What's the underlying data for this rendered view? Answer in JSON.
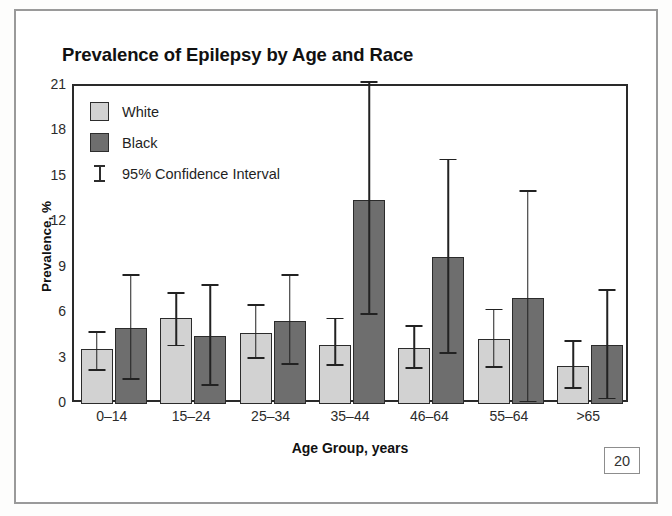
{
  "figure": {
    "number_label": "20"
  },
  "chart_data": {
    "type": "bar",
    "title": "Prevalence of Epilepsy by Age and Race",
    "xlabel": "Age Group, years",
    "ylabel": "Prevalence, %",
    "ylim": [
      0,
      21
    ],
    "ytick_labels": [
      "0",
      "3",
      "6",
      "9",
      "12",
      "15",
      "18",
      "21"
    ],
    "ytick_values": [
      0,
      3,
      6,
      9,
      12,
      15,
      18,
      21
    ],
    "grid": false,
    "legend_position": "top-left-inside",
    "categories": [
      "0–14",
      "15–24",
      "25–34",
      "35–44",
      "46–64",
      "55–64",
      ">65"
    ],
    "series": [
      {
        "name": "White",
        "color": "#d2d2d2",
        "values": [
          3.6,
          5.7,
          4.7,
          3.9,
          3.7,
          4.3,
          2.5
        ],
        "ci_lower": [
          2.2,
          3.8,
          3.0,
          2.5,
          2.3,
          2.4,
          1.0
        ],
        "ci_upper": [
          4.8,
          7.4,
          6.6,
          5.7,
          5.2,
          6.3,
          4.2
        ]
      },
      {
        "name": "Black",
        "color": "#6e6e6e",
        "values": [
          5.0,
          4.5,
          5.5,
          13.5,
          9.7,
          7.0,
          3.9
        ],
        "ci_lower": [
          1.6,
          1.2,
          2.6,
          5.9,
          3.3,
          0.1,
          0.3
        ],
        "ci_upper": [
          8.6,
          7.9,
          8.6,
          21.3,
          16.2,
          14.1,
          7.6
        ]
      }
    ],
    "legend_entries": [
      {
        "label": "White",
        "kind": "swatch",
        "color": "#d2d2d2"
      },
      {
        "label": "Black",
        "kind": "swatch",
        "color": "#6e6e6e"
      },
      {
        "label": "95% Confidence Interval",
        "kind": "errorbar",
        "color": "#2d2d2d"
      }
    ]
  }
}
